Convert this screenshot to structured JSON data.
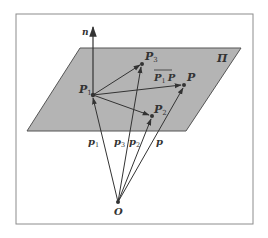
{
  "diagram": {
    "colors": {
      "background": "#ffffff",
      "frame": "#8c8c8c",
      "plane_fill": "#b4b4b4",
      "plane_edge": "#555555",
      "ink": "#333333"
    },
    "plane": {
      "label": "Π"
    },
    "normal": {
      "label": "n"
    },
    "origin": {
      "label": "O"
    },
    "points": [
      {
        "id": "P1",
        "base": "P",
        "sub": "1"
      },
      {
        "id": "P2",
        "base": "P",
        "sub": "2"
      },
      {
        "id": "P3",
        "base": "P",
        "sub": "3"
      },
      {
        "id": "P",
        "base": "P",
        "sub": ""
      }
    ],
    "position_vectors": [
      {
        "id": "p1",
        "base": "p",
        "sub": "1"
      },
      {
        "id": "p3",
        "base": "p",
        "sub": "3"
      },
      {
        "id": "p2",
        "base": "p",
        "sub": "2"
      },
      {
        "id": "p",
        "base": "p",
        "sub": ""
      }
    ],
    "vector_label": {
      "from_base": "P",
      "from_sub": "1",
      "to": "P"
    }
  }
}
